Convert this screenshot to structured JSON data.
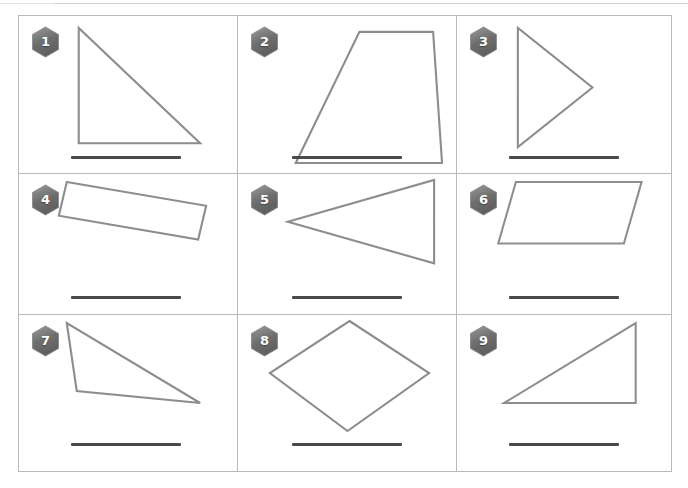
{
  "page": {
    "kind": "geometry-shape-identification-worksheet",
    "width": 688,
    "height": 488,
    "background_color": "#ffffff",
    "top_rule_color": "#cfcfcf"
  },
  "table": {
    "border_color": "#b9b9b9",
    "columns": 3,
    "rows": 3,
    "cell_count": 9
  },
  "style": {
    "shape_stroke_color": "#8d8d8d",
    "shape_stroke_width": 2.1,
    "badge_fill_dark": "#6e6e6e",
    "badge_fill_light": "#9a9a9a",
    "badge_text_color": "#ffffff",
    "answer_line_color": "#4a4a4a"
  },
  "cells": [
    {
      "number": "1",
      "shape_name": "right-triangle",
      "answer_value": "",
      "answer_placeholder": "",
      "points": "60,12 60,128 182,128",
      "answer_line": {
        "left": 52,
        "top": 140,
        "width": 110
      }
    },
    {
      "number": "2",
      "shape_name": "trapezoid",
      "answer_value": "",
      "answer_placeholder": "",
      "points": "58,148 122,16 196,16 205,148",
      "answer_line": {
        "left": 54,
        "top": 140,
        "width": 110
      }
    },
    {
      "number": "3",
      "shape_name": "triangle-pointing-right",
      "answer_value": "",
      "answer_placeholder": "",
      "points": "62,12 62,132 138,72",
      "answer_line": {
        "left": 52,
        "top": 140,
        "width": 110
      }
    },
    {
      "number": "4",
      "shape_name": "tilted-rectangle",
      "answer_value": "",
      "answer_placeholder": "",
      "points": "48,8 188,32 180,66 40,42",
      "answer_line": {
        "left": 52,
        "top": 122,
        "width": 110
      }
    },
    {
      "number": "5",
      "shape_name": "triangle-pointing-left",
      "answer_value": "",
      "answer_placeholder": "",
      "points": "50,48 197,6 197,90",
      "answer_line": {
        "left": 54,
        "top": 122,
        "width": 110
      }
    },
    {
      "number": "6",
      "shape_name": "parallelogram",
      "answer_value": "",
      "answer_placeholder": "",
      "points": "60,8 188,8 170,70 42,70",
      "answer_line": {
        "left": 52,
        "top": 122,
        "width": 110
      }
    },
    {
      "number": "7",
      "shape_name": "obtuse-triangle",
      "answer_value": "",
      "answer_placeholder": "",
      "points": "48,8 58,76 182,88",
      "answer_line": {
        "left": 52,
        "top": 128,
        "width": 110
      }
    },
    {
      "number": "8",
      "shape_name": "rhombus",
      "answer_value": "",
      "answer_placeholder": "",
      "points": "112,6 192,58 110,116 32,58",
      "answer_line": {
        "left": 54,
        "top": 128,
        "width": 110
      }
    },
    {
      "number": "9",
      "shape_name": "right-triangle",
      "answer_value": "",
      "answer_placeholder": "",
      "points": "48,88 182,8 182,88",
      "answer_line": {
        "left": 52,
        "top": 128,
        "width": 110
      }
    }
  ]
}
